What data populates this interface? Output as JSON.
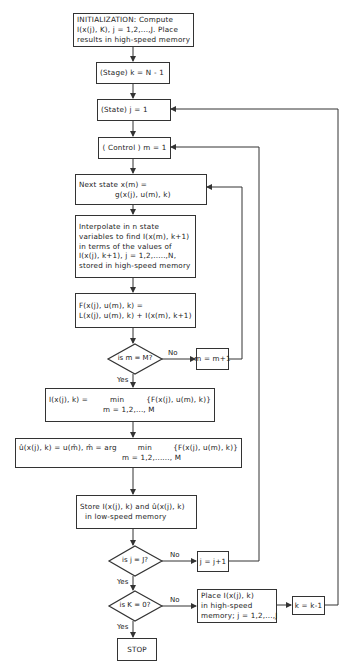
{
  "flowchart": {
    "init": [
      "INITIALIZATION:  Compute",
      "I(x(j), K), j = 1,2,...,J.  Place",
      "results in high-speed memory"
    ],
    "stage": "(Stage)  k = N - 1",
    "state": "(State)  j = 1",
    "control": "( Control )  m = 1",
    "next_state": [
      "Next state  x(m) =",
      "g(x(j), u(m), k)"
    ],
    "interpolate": [
      "Interpolate in n state",
      "variables to find I(x(m), k+1)",
      "in terms of the values of",
      "I(x(j), k+1), j = 1,2,.....,N,",
      "stored in high-speed memory"
    ],
    "F_def": [
      "F(x(j), u(m), k) =",
      "L(x(j), u(m), k) + I(x(m), k+1)"
    ],
    "decision_m": "is m = M?",
    "m_increment": "m = m+1",
    "I_min": {
      "lhs": "I(x(j), k) =",
      "op": "min",
      "sub": "m = 1,2,..., M",
      "rhs": "{F(x(j), u(m), k)}"
    },
    "u_hat": {
      "lhs": "û(x(j), k) = u(m̂), m̂ = arg",
      "op": "min",
      "sub": "m = 1,2,......, M",
      "rhs": "{F(x(j), u(m), k)}"
    },
    "store": [
      "Store I(x(j), k) and û(x(j), k)",
      "in low-speed memory"
    ],
    "decision_j": "is j = J?",
    "j_increment": "j = j+1",
    "decision_k": "is K = 0?",
    "place": [
      "Place I(x(j), k)",
      "in high-speed",
      "memory; j = 1,2,...,J"
    ],
    "k_decrement": "k = k-1",
    "stop": "STOP",
    "labels": {
      "yes": "Yes",
      "no": "No"
    }
  }
}
